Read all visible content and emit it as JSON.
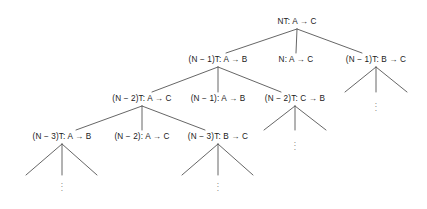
{
  "figure": {
    "type": "tree-diagram",
    "width": 427,
    "height": 209,
    "background_color": "#ffffff",
    "line_color": "#555555",
    "text_color": "#1a1a1a",
    "arrow_glyph": "→",
    "minus_glyph": "−",
    "ellipsis_dot": "·"
  },
  "nodes": [
    {
      "id": "n0",
      "level": 0,
      "label": "NT: A → C",
      "x": 297,
      "y": 22
    },
    {
      "id": "n1",
      "level": 1,
      "label": "(N − 1)T: A → B",
      "x": 218,
      "y": 60
    },
    {
      "id": "n2",
      "level": 1,
      "label": "N: A → C",
      "x": 296,
      "y": 60
    },
    {
      "id": "n3",
      "level": 1,
      "label": "(N − 1)T: B → C",
      "x": 376,
      "y": 60
    },
    {
      "id": "n4",
      "level": 2,
      "label": "(N − 2)T: A → C",
      "x": 142,
      "y": 99
    },
    {
      "id": "n5",
      "level": 2,
      "label": "(N − 1): A → B",
      "x": 218,
      "y": 99
    },
    {
      "id": "n6",
      "level": 2,
      "label": "(N − 2)T: C → B",
      "x": 295,
      "y": 99
    },
    {
      "id": "n7",
      "level": 3,
      "label": "(N − 3)T: A → B",
      "x": 62,
      "y": 137
    },
    {
      "id": "n8",
      "level": 3,
      "label": "(N − 2): A → C",
      "x": 142,
      "y": 137
    },
    {
      "id": "n9",
      "level": 3,
      "label": "(N − 3)T: B → C",
      "x": 218,
      "y": 137
    }
  ],
  "edges": [
    {
      "from": "n0",
      "to": "n1",
      "x1": 297,
      "y1": 29,
      "x2": 226,
      "y2": 53
    },
    {
      "from": "n0",
      "to": "n2",
      "x1": 297,
      "y1": 29,
      "x2": 296,
      "y2": 53
    },
    {
      "from": "n0",
      "to": "n3",
      "x1": 297,
      "y1": 29,
      "x2": 362,
      "y2": 53
    },
    {
      "from": "n1",
      "to": "n4",
      "x1": 218,
      "y1": 67,
      "x2": 152,
      "y2": 92
    },
    {
      "from": "n1",
      "to": "n5",
      "x1": 218,
      "y1": 67,
      "x2": 218,
      "y2": 92
    },
    {
      "from": "n1",
      "to": "n6",
      "x1": 218,
      "y1": 67,
      "x2": 281,
      "y2": 92
    },
    {
      "from": "n4",
      "to": "n7",
      "x1": 142,
      "y1": 106,
      "x2": 76,
      "y2": 130
    },
    {
      "from": "n4",
      "to": "n8",
      "x1": 142,
      "y1": 106,
      "x2": 142,
      "y2": 130
    },
    {
      "from": "n4",
      "to": "n9",
      "x1": 142,
      "y1": 106,
      "x2": 205,
      "y2": 130
    },
    {
      "from": "n3",
      "to": "r1",
      "x1": 376,
      "y1": 67,
      "x2": 345,
      "y2": 92
    },
    {
      "from": "n3",
      "to": "r2",
      "x1": 376,
      "y1": 67,
      "x2": 376,
      "y2": 92
    },
    {
      "from": "n3",
      "to": "r3",
      "x1": 376,
      "y1": 67,
      "x2": 407,
      "y2": 92
    },
    {
      "from": "n6",
      "to": "m1",
      "x1": 295,
      "y1": 106,
      "x2": 264,
      "y2": 130
    },
    {
      "from": "n6",
      "to": "m2",
      "x1": 295,
      "y1": 106,
      "x2": 295,
      "y2": 130
    },
    {
      "from": "n6",
      "to": "m3",
      "x1": 295,
      "y1": 106,
      "x2": 326,
      "y2": 130
    },
    {
      "from": "n7",
      "to": "b1",
      "x1": 62,
      "y1": 144,
      "x2": 26,
      "y2": 175
    },
    {
      "from": "n7",
      "to": "b2",
      "x1": 62,
      "y1": 144,
      "x2": 62,
      "y2": 175
    },
    {
      "from": "n7",
      "to": "b3",
      "x1": 62,
      "y1": 144,
      "x2": 97,
      "y2": 175
    },
    {
      "from": "n9",
      "to": "c1",
      "x1": 218,
      "y1": 144,
      "x2": 182,
      "y2": 175
    },
    {
      "from": "n9",
      "to": "c2",
      "x1": 218,
      "y1": 144,
      "x2": 218,
      "y2": 175
    },
    {
      "from": "n9",
      "to": "c3",
      "x1": 218,
      "y1": 144,
      "x2": 253,
      "y2": 175
    }
  ],
  "ellipses": [
    {
      "id": "e-right",
      "x": 376,
      "y": 107
    },
    {
      "id": "e-mid",
      "x": 295,
      "y": 146
    },
    {
      "id": "e-bottom-left",
      "x": 62,
      "y": 187
    },
    {
      "id": "e-bottom-mid",
      "x": 218,
      "y": 187
    }
  ]
}
